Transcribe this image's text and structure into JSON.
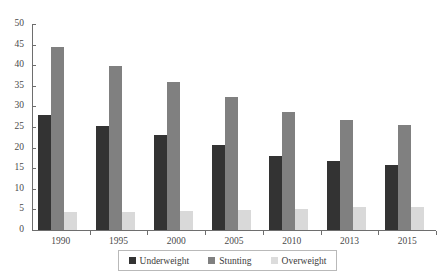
{
  "chart_data": {
    "type": "bar",
    "title": "",
    "subtitle": "",
    "xlabel": "",
    "ylabel": "",
    "categories": [
      "1990",
      "1995",
      "2000",
      "2005",
      "2010",
      "2013",
      "2015"
    ],
    "series": [
      {
        "name": "Underweight",
        "color": "#333333",
        "values": [
          27.9,
          25.2,
          23.0,
          20.6,
          18.0,
          16.7,
          15.8
        ]
      },
      {
        "name": "Stunting",
        "color": "#808080",
        "values": [
          44.4,
          39.8,
          36.0,
          32.4,
          28.6,
          26.8,
          25.6
        ]
      },
      {
        "name": "Overweight",
        "color": "#d9d9d9",
        "values": [
          4.3,
          4.4,
          4.6,
          4.8,
          5.2,
          5.5,
          5.7
        ]
      }
    ],
    "ylim": [
      0,
      50
    ],
    "yticks": [
      0,
      5,
      10,
      15,
      20,
      25,
      30,
      35,
      40,
      45,
      50
    ],
    "ytick_labels": [
      "0",
      "5",
      "10",
      "15",
      "20",
      "25",
      "30",
      "35",
      "40",
      "45",
      "50"
    ],
    "grid": false,
    "legend_position": "bottom"
  },
  "legend": {
    "items": [
      {
        "label": "Underweight",
        "swatch": "underweight"
      },
      {
        "label": "Stunting",
        "swatch": "stunting"
      },
      {
        "label": "Overweight",
        "swatch": "overweight"
      }
    ]
  }
}
